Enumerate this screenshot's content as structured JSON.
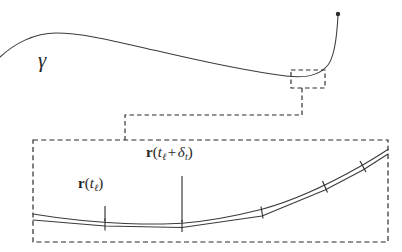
{
  "figure": {
    "background_color": "#ffffff",
    "stroke_color": "#3a3a3a",
    "dash_color": "#2b2b2b",
    "labels": {
      "curve_symbol": "γ",
      "point_a": {
        "full_text": "r(tℓ)",
        "vector_name": "r",
        "argument": "tℓ",
        "subscript": "ℓ",
        "variable": "t"
      },
      "point_b": {
        "full_text": "r(tℓ + δt)",
        "vector_name": "r",
        "variable": "t",
        "subscript": "ℓ",
        "operator": "+",
        "delta_symbol": "δ",
        "delta_subscript": "t"
      }
    },
    "panels": {
      "overview": {
        "name": "overview-panel",
        "description": "smooth open curve gamma with endpoint dot and a dashed zoom-region box"
      },
      "detail": {
        "name": "detail-panel",
        "description": "magnified view showing smooth curve overlaid by chord polyline with tick marks at node points"
      }
    }
  },
  "chart_data": {
    "type": "line",
    "title": "γ",
    "xlabel": "",
    "ylabel": "",
    "grid": false,
    "legend": null,
    "series": [
      {
        "name": "gamma-overview-curve",
        "comment": "smooth curve in overview panel, screen pixel coordinates",
        "points": [
          [
            0,
            57
          ],
          [
            10,
            48
          ],
          [
            22,
            41
          ],
          [
            36,
            36
          ],
          [
            52,
            33
          ],
          [
            72,
            33
          ],
          [
            95,
            36
          ],
          [
            120,
            41
          ],
          [
            150,
            48
          ],
          [
            180,
            55
          ],
          [
            212,
            62
          ],
          [
            244,
            69
          ],
          [
            268,
            73
          ],
          [
            288,
            76
          ],
          [
            302,
            77
          ],
          [
            314,
            76
          ],
          [
            322,
            73
          ],
          [
            328,
            68
          ],
          [
            332,
            60
          ],
          [
            335,
            48
          ],
          [
            337,
            34
          ],
          [
            338,
            22
          ],
          [
            338,
            14
          ]
        ],
        "endpoint_marker": {
          "x": 338,
          "y": 14,
          "type": "filled-dot",
          "radius": 2.2
        }
      },
      {
        "name": "detail-smooth-curve",
        "comment": "magnified smooth curve, screen pixel coordinates",
        "points": [
          [
            33,
            214
          ],
          [
            60,
            218
          ],
          [
            85,
            221
          ],
          [
            105,
            222.5
          ],
          [
            130,
            223.5
          ],
          [
            155,
            223.8
          ],
          [
            182,
            223.2
          ],
          [
            205,
            221
          ],
          [
            228,
            217.5
          ],
          [
            248,
            213
          ],
          [
            262,
            209.5
          ],
          [
            285,
            202
          ],
          [
            305,
            194
          ],
          [
            325,
            185
          ],
          [
            345,
            175
          ],
          [
            363,
            165
          ],
          [
            378,
            156
          ],
          [
            388,
            150
          ]
        ]
      },
      {
        "name": "detail-chord-polyline",
        "comment": "piecewise linear approximation through node points, pixel coordinates",
        "points": [
          [
            33,
            220
          ],
          [
            105,
            226
          ],
          [
            182,
            227.5
          ],
          [
            262,
            216
          ],
          [
            325,
            190
          ],
          [
            363,
            170
          ],
          [
            388,
            154
          ]
        ]
      }
    ],
    "nodes": [
      {
        "label": "r(tℓ)",
        "x": 105,
        "y": 224,
        "tick": true
      },
      {
        "label": "r(tℓ + δt)",
        "x": 182,
        "y": 225,
        "tick": true
      },
      {
        "label": "",
        "x": 262,
        "y": 212,
        "tick": true
      },
      {
        "label": "",
        "x": 325,
        "y": 187,
        "tick": true
      },
      {
        "label": "",
        "x": 363,
        "y": 167,
        "tick": true
      }
    ],
    "annotations": [
      {
        "name": "gamma-symbol",
        "text": "γ",
        "x": 48,
        "y": 64
      },
      {
        "name": "leader-r-tl",
        "from": [
          105,
          224
        ],
        "to": [
          105,
          206
        ]
      },
      {
        "name": "leader-r-tl-delta",
        "from": [
          182,
          225
        ],
        "to": [
          182,
          190
        ]
      }
    ],
    "zoom_box": {
      "x": 291,
      "y": 70,
      "width": 34,
      "height": 18
    },
    "detail_box": {
      "x": 33,
      "y": 140,
      "width": 355,
      "height": 102
    },
    "connector_path": [
      [
        302,
        88
      ],
      [
        302,
        115
      ],
      [
        125,
        115
      ],
      [
        125,
        140
      ]
    ]
  }
}
